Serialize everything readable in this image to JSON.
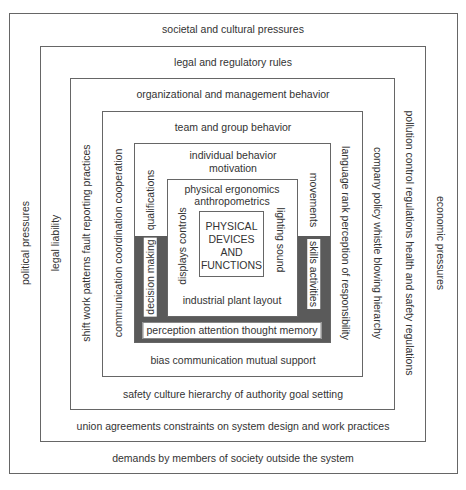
{
  "diagram": {
    "layers": [
      {
        "name": "societal",
        "top": "societal and cultural pressures",
        "left": "political pressures",
        "right": "economic pressures",
        "bottom": "demands by members of society outside the system"
      },
      {
        "name": "legal",
        "top": "legal and regulatory rules",
        "left": "legal liability",
        "right": "pollution control regulations   health and safety regulations",
        "bottom": "union agreements   constraints on system design and work practices"
      },
      {
        "name": "organizational",
        "top": "organizational and management behavior",
        "left": "shift work patterns   fault reporting practices",
        "right": "company policy   whistle blowing   hierarchy",
        "bottom": "safety culture   hierarchy of authority   goal setting"
      },
      {
        "name": "team",
        "top": "team and group behavior",
        "left": "communication   coordination   cooperation",
        "right": "language   rank   perception of responsibility",
        "bottom": "bias   communication   mutual support"
      },
      {
        "name": "individual",
        "top_line1": "individual behavior",
        "top_line2": "motivation",
        "left_upper": "qualifications",
        "left_lower": "decision making",
        "right_upper": "movements",
        "right_lower": "skills   activities",
        "bottom": "perception   attention   thought   memory"
      },
      {
        "name": "physical-ergonomics",
        "top_line1": "physical ergonomics",
        "top_line2": "anthropometrics",
        "left": "displays   controls",
        "right": "lighting   sound",
        "bottom": "industrial plant layout"
      }
    ],
    "core": {
      "line1": "PHYSICAL",
      "line2": "DEVICES",
      "line3": "AND",
      "line4": "FUNCTIONS"
    },
    "colors": {
      "border": "#666666",
      "dark_band": "#5a5a5a",
      "text": "#333333",
      "background": "#ffffff"
    }
  }
}
